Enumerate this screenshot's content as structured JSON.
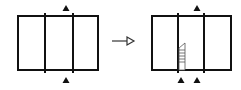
{
  "diagram": {
    "colors": {
      "stroke": "#111111",
      "background": "#ffffff",
      "hatch": "#555555"
    },
    "left_frame": {
      "x": 18,
      "y": 16,
      "w": 80,
      "h": 54,
      "dividers_x": [
        45,
        73
      ],
      "top_markers_x": [
        66
      ],
      "bottom_markers_x": [
        66
      ]
    },
    "arrow": {
      "x1": 112,
      "x2": 134,
      "y": 41,
      "head": "open-triangle"
    },
    "right_frame": {
      "x": 152,
      "y": 16,
      "w": 79,
      "h": 54,
      "dividers_x": [
        178,
        204
      ],
      "top_markers_x": [
        197
      ],
      "bottom_markers_x": [
        181,
        197
      ],
      "hatched_strip": {
        "x": 179,
        "y": 43,
        "w": 6,
        "h": 27
      }
    }
  }
}
